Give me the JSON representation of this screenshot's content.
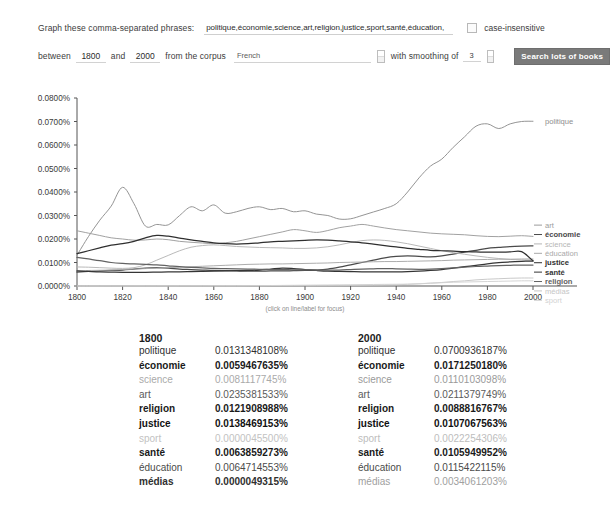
{
  "form": {
    "phrases_label": "Graph these comma-separated phrases:",
    "phrases_value": "politique,économie,science,art,religion,justice,sport,santé,éducation,",
    "case_insensitive_label": "case-insensitive",
    "between_label": "between",
    "year_start": "1800",
    "and_label": "and",
    "year_end": "2000",
    "corpus_label": "from the corpus",
    "corpus_value": "French",
    "smoothing_label": "with smoothing of",
    "smoothing_value": "3",
    "search_button": "Search lots of books"
  },
  "chart_hint": "(click on line/label for focus)",
  "chart_data": {
    "type": "line",
    "title": "",
    "xlabel": "",
    "ylabel": "",
    "xlim": [
      1800,
      2000
    ],
    "ylim": [
      0.0,
      0.08
    ],
    "grid": false,
    "legend_position": "right",
    "xticks": [
      1800,
      1820,
      1840,
      1860,
      1880,
      1900,
      1920,
      1940,
      1960,
      1980,
      2000
    ],
    "yticks": [
      "0.0000%",
      "0.0100%",
      "0.0200%",
      "0.0300%",
      "0.0400%",
      "0.0500%",
      "0.0600%",
      "0.0700%",
      "0.0800%"
    ],
    "x": [
      1800,
      1805,
      1810,
      1815,
      1820,
      1825,
      1830,
      1835,
      1840,
      1845,
      1850,
      1855,
      1860,
      1865,
      1870,
      1875,
      1880,
      1885,
      1890,
      1895,
      1900,
      1905,
      1910,
      1915,
      1920,
      1925,
      1930,
      1935,
      1940,
      1945,
      1950,
      1955,
      1960,
      1965,
      1970,
      1975,
      1980,
      1985,
      1990,
      1995,
      2000
    ],
    "series": [
      {
        "name": "politique",
        "color": "#8e8e8e",
        "values": [
          0.0131,
          0.021,
          0.028,
          0.034,
          0.042,
          0.035,
          0.0255,
          0.0262,
          0.026,
          0.03,
          0.0337,
          0.032,
          0.0345,
          0.031,
          0.0316,
          0.033,
          0.0337,
          0.0325,
          0.033,
          0.0316,
          0.032,
          0.0306,
          0.03,
          0.0285,
          0.0286,
          0.03,
          0.0315,
          0.033,
          0.035,
          0.04,
          0.046,
          0.051,
          0.054,
          0.059,
          0.0635,
          0.068,
          0.069,
          0.067,
          0.069,
          0.07,
          0.0701
        ]
      },
      {
        "name": "art",
        "color": "#9c9c9c",
        "values": [
          0.0235,
          0.0225,
          0.0215,
          0.0205,
          0.02,
          0.0195,
          0.0196,
          0.02,
          0.0197,
          0.019,
          0.0186,
          0.0183,
          0.018,
          0.0184,
          0.019,
          0.02,
          0.021,
          0.022,
          0.023,
          0.024,
          0.0235,
          0.0228,
          0.0236,
          0.0248,
          0.0255,
          0.0262,
          0.0255,
          0.0247,
          0.024,
          0.0235,
          0.023,
          0.0225,
          0.0222,
          0.022,
          0.0218,
          0.0214,
          0.0211,
          0.021,
          0.0212,
          0.0214,
          0.0211
        ]
      },
      {
        "name": "économie",
        "color": "#4a4a4a",
        "values": [
          0.0059,
          0.0062,
          0.0064,
          0.0066,
          0.0068,
          0.0072,
          0.0076,
          0.0078,
          0.0076,
          0.0072,
          0.007,
          0.0068,
          0.0066,
          0.0065,
          0.0064,
          0.0063,
          0.0063,
          0.0064,
          0.0064,
          0.0065,
          0.0066,
          0.0068,
          0.0072,
          0.008,
          0.009,
          0.01,
          0.011,
          0.012,
          0.0126,
          0.0128,
          0.0126,
          0.0124,
          0.0128,
          0.0136,
          0.0144,
          0.0152,
          0.016,
          0.0164,
          0.0168,
          0.017,
          0.0171
        ]
      },
      {
        "name": "science",
        "color": "#b5b5b5",
        "values": [
          0.0081,
          0.008,
          0.0078,
          0.0076,
          0.0075,
          0.0078,
          0.009,
          0.011,
          0.013,
          0.015,
          0.0165,
          0.0172,
          0.0175,
          0.0172,
          0.0168,
          0.0166,
          0.0164,
          0.0163,
          0.0162,
          0.016,
          0.016,
          0.0162,
          0.0167,
          0.0175,
          0.0185,
          0.0193,
          0.0196,
          0.0194,
          0.0188,
          0.018,
          0.017,
          0.016,
          0.015,
          0.0142,
          0.0135,
          0.0128,
          0.0122,
          0.0117,
          0.0113,
          0.0111,
          0.011
        ]
      },
      {
        "name": "éducation",
        "color": "#a8a8a8",
        "values": [
          0.0065,
          0.0066,
          0.0067,
          0.0068,
          0.007,
          0.0072,
          0.0074,
          0.0076,
          0.0078,
          0.008,
          0.0082,
          0.0084,
          0.0086,
          0.0088,
          0.009,
          0.0092,
          0.0093,
          0.0094,
          0.0094,
          0.0095,
          0.0096,
          0.0097,
          0.0098,
          0.01,
          0.0101,
          0.0102,
          0.0103,
          0.0104,
          0.0104,
          0.0105,
          0.0106,
          0.0107,
          0.0108,
          0.011,
          0.0111,
          0.0112,
          0.0113,
          0.0114,
          0.0114,
          0.0115,
          0.0115
        ]
      },
      {
        "name": "justice",
        "color": "#2f2f2f",
        "values": [
          0.0138,
          0.015,
          0.0162,
          0.0174,
          0.018,
          0.019,
          0.0205,
          0.0215,
          0.0212,
          0.0204,
          0.0196,
          0.019,
          0.0184,
          0.018,
          0.0178,
          0.018,
          0.0184,
          0.0188,
          0.019,
          0.0192,
          0.0194,
          0.0196,
          0.0195,
          0.0192,
          0.0188,
          0.0184,
          0.0178,
          0.0172,
          0.0166,
          0.016,
          0.0156,
          0.0152,
          0.015,
          0.0148,
          0.0146,
          0.0145,
          0.0144,
          0.0144,
          0.0145,
          0.0146,
          0.0107
        ]
      },
      {
        "name": "santé",
        "color": "#353535",
        "values": [
          0.0064,
          0.0062,
          0.006,
          0.0059,
          0.0058,
          0.0058,
          0.0058,
          0.0059,
          0.006,
          0.006,
          0.0061,
          0.0062,
          0.0063,
          0.0064,
          0.0065,
          0.0066,
          0.0068,
          0.0072,
          0.0076,
          0.0074,
          0.007,
          0.0066,
          0.0063,
          0.0062,
          0.0061,
          0.006,
          0.006,
          0.006,
          0.006,
          0.0061,
          0.0063,
          0.0066,
          0.007,
          0.0076,
          0.0082,
          0.0088,
          0.0094,
          0.0099,
          0.0103,
          0.0105,
          0.0106
        ]
      },
      {
        "name": "religion",
        "color": "#626262",
        "values": [
          0.0122,
          0.0115,
          0.0108,
          0.01,
          0.0096,
          0.0094,
          0.0092,
          0.009,
          0.0086,
          0.0082,
          0.0079,
          0.0077,
          0.0075,
          0.0074,
          0.0073,
          0.0072,
          0.0071,
          0.007,
          0.007,
          0.0069,
          0.0069,
          0.0068,
          0.0068,
          0.0068,
          0.007,
          0.0072,
          0.0073,
          0.0074,
          0.0073,
          0.0072,
          0.0071,
          0.0072,
          0.0074,
          0.0077,
          0.008,
          0.0083,
          0.0085,
          0.0087,
          0.0088,
          0.0089,
          0.0089
        ]
      },
      {
        "name": "médias",
        "color": "#c6c6c6",
        "values": [
          4.93e-06,
          1e-05,
          1e-05,
          2e-05,
          2e-05,
          3e-05,
          3e-05,
          4e-05,
          4e-05,
          5e-05,
          5e-05,
          6e-05,
          6e-05,
          7e-05,
          7e-05,
          8e-05,
          8e-05,
          9e-05,
          9e-05,
          0.0001,
          0.0001,
          0.00012,
          0.00014,
          0.00016,
          0.0002,
          0.00025,
          0.0003,
          0.0004,
          0.0005,
          0.0007,
          0.0009,
          0.0012,
          0.0015,
          0.0019,
          0.0022,
          0.0026,
          0.0029,
          0.0031,
          0.0033,
          0.0034,
          0.0034
        ]
      },
      {
        "name": "sport",
        "color": "#d2d2d2",
        "values": [
          4.6e-06,
          1e-05,
          1e-05,
          2e-05,
          2e-05,
          3e-05,
          3e-05,
          4e-05,
          4e-05,
          5e-05,
          6e-05,
          7e-05,
          8e-05,
          9e-05,
          0.0001,
          0.00012,
          0.00015,
          0.0002,
          0.00025,
          0.0003,
          0.00035,
          0.0004,
          0.00045,
          0.0005,
          0.00055,
          0.0006,
          0.00065,
          0.0007,
          0.00075,
          0.0008,
          0.001,
          0.0012,
          0.0014,
          0.0016,
          0.0017,
          0.0018,
          0.0019,
          0.002,
          0.0021,
          0.0022,
          0.0022
        ]
      }
    ],
    "legend_order": [
      "art",
      "économie",
      "science",
      "éducation",
      "justice",
      "santé",
      "religion",
      "médias",
      "sport"
    ],
    "top_legend": "politique"
  },
  "tables": [
    {
      "year": "1800",
      "rows": [
        {
          "term": "politique",
          "value": "0.0131348108%",
          "weight": "normal",
          "shade": "#303030"
        },
        {
          "term": "économie",
          "value": "0.0059467635%",
          "weight": "bold",
          "shade": "#1a1a1a"
        },
        {
          "term": "science",
          "value": "0.0081117745%",
          "weight": "normal",
          "shade": "#aaaaaa"
        },
        {
          "term": "art",
          "value": "0.0235381533%",
          "weight": "normal",
          "shade": "#5a5a5a"
        },
        {
          "term": "religion",
          "value": "0.0121908988%",
          "weight": "bold",
          "shade": "#1a1a1a"
        },
        {
          "term": "justice",
          "value": "0.0138469153%",
          "weight": "bold",
          "shade": "#111111"
        },
        {
          "term": "sport",
          "value": "0.0000045500%",
          "weight": "normal",
          "shade": "#c2c2c2"
        },
        {
          "term": "santé",
          "value": "0.0063859273%",
          "weight": "bold",
          "shade": "#1a1a1a"
        },
        {
          "term": "éducation",
          "value": "0.0064714553%",
          "weight": "normal",
          "shade": "#4a4a4a"
        },
        {
          "term": "médias",
          "value": "0.0000049315%",
          "weight": "bold",
          "shade": "#303030"
        }
      ]
    },
    {
      "year": "2000",
      "rows": [
        {
          "term": "politique",
          "value": "0.0700936187%",
          "weight": "normal",
          "shade": "#303030"
        },
        {
          "term": "économie",
          "value": "0.0171250180%",
          "weight": "bold",
          "shade": "#1a1a1a"
        },
        {
          "term": "science",
          "value": "0.0110103098%",
          "weight": "normal",
          "shade": "#9a9a9a"
        },
        {
          "term": "art",
          "value": "0.0211379749%",
          "weight": "normal",
          "shade": "#5a5a5a"
        },
        {
          "term": "religion",
          "value": "0.0088816767%",
          "weight": "bold",
          "shade": "#1a1a1a"
        },
        {
          "term": "justice",
          "value": "0.0107067563%",
          "weight": "bold",
          "shade": "#111111"
        },
        {
          "term": "sport",
          "value": "0.0022254306%",
          "weight": "normal",
          "shade": "#bdbdbd"
        },
        {
          "term": "santé",
          "value": "0.0105949952%",
          "weight": "bold",
          "shade": "#1a1a1a"
        },
        {
          "term": "éducation",
          "value": "0.0115422115%",
          "weight": "normal",
          "shade": "#4a4a4a"
        },
        {
          "term": "médias",
          "value": "0.0034061203%",
          "weight": "normal",
          "shade": "#a0a0a0"
        }
      ]
    }
  ]
}
